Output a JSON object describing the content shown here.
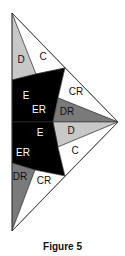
{
  "caption": "Figure 5",
  "colors": {
    "black": "#000000",
    "dark_gray": "#7a7a7a",
    "light_gray": "#c8c8c8",
    "white": "#ffffff",
    "stroke": "#333333"
  },
  "regions": [
    {
      "id": "D-top",
      "label": "D",
      "fill": "light_gray",
      "points": "12,13 36,74 12,80",
      "label_pos": [
        21,
        60
      ],
      "label_color": "#111"
    },
    {
      "id": "C-top",
      "label": "C",
      "fill": "white",
      "points": "12,13 65,68 36,74",
      "label_pos": [
        43,
        57
      ],
      "label_color": "#111"
    },
    {
      "id": "E-top",
      "label": "E",
      "fill": "black",
      "points": "12,80 36,74 65,68 58,98 53,122 12,122",
      "label_pos": [
        26,
        96
      ],
      "label_color": "#fff"
    },
    {
      "id": "ER-top",
      "label": "ER",
      "fill": "black",
      "points": "",
      "label_pos": [
        39,
        110
      ],
      "label_color": "#fff"
    },
    {
      "id": "CR-top",
      "label": "CR",
      "fill": "white",
      "points": "65,68 118,122 58,98",
      "label_pos": [
        76,
        92
      ],
      "label_color": "#111"
    },
    {
      "id": "DR-top",
      "label": "DR",
      "fill": "dark_gray",
      "points": "58,98 118,122 53,122",
      "label_pos": [
        67,
        112
      ],
      "label_color": "#111"
    },
    {
      "id": "D-bottom",
      "label": "D",
      "fill": "light_gray",
      "points": "53,122 118,122 58,147",
      "label_pos": [
        71,
        131
      ],
      "label_color": "#111"
    },
    {
      "id": "E-bottom",
      "label": "E",
      "fill": "black",
      "points": "12,122 53,122 58,147 65,176 35,170 12,163",
      "label_pos": [
        40,
        133
      ],
      "label_color": "#fff"
    },
    {
      "id": "ER-bottom",
      "label": "ER",
      "fill": "black",
      "points": "",
      "label_pos": [
        23,
        153
      ],
      "label_color": "#fff"
    },
    {
      "id": "C-bottom",
      "label": "C",
      "fill": "white",
      "points": "58,147 118,122 65,176",
      "label_pos": [
        75,
        151
      ],
      "label_color": "#111"
    },
    {
      "id": "DR-bottom",
      "label": "DR",
      "fill": "dark_gray",
      "points": "12,163 35,170 12,231",
      "label_pos": [
        20,
        177
      ],
      "label_color": "#111"
    },
    {
      "id": "CR-bottom",
      "label": "CR",
      "fill": "white",
      "points": "35,170 65,176 12,231",
      "label_pos": [
        44,
        181
      ],
      "label_color": "#111"
    }
  ],
  "outline": "12,13 118,122 12,231"
}
